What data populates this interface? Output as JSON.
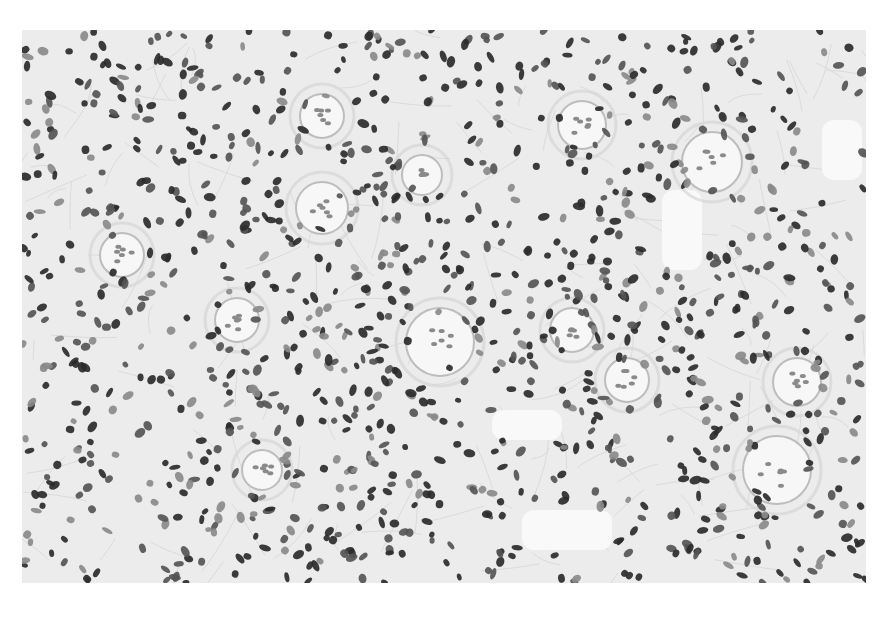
{
  "image": {
    "kind": "histology-micrograph",
    "stain": "grayscale",
    "panel": {
      "x": 22,
      "y": 30,
      "width": 844,
      "height": 553
    },
    "colors": {
      "page_background": "#ffffff",
      "stroma": "#ececec",
      "stroma_fiber": "#d6d6d6",
      "nucleus_dark": "#2b2b2b",
      "nucleus_mid": "#555555",
      "nucleus_light": "#8a8a8a",
      "whorl_fill": "#f7f7f7",
      "whorl_edge": "#bdbdbd",
      "clear_space": "#fbfbfb"
    },
    "whorls": [
      {
        "cx": 418,
        "cy": 312,
        "r": 34
      },
      {
        "cx": 300,
        "cy": 178,
        "r": 26
      },
      {
        "cx": 690,
        "cy": 132,
        "r": 30
      },
      {
        "cx": 300,
        "cy": 86,
        "r": 22
      },
      {
        "cx": 775,
        "cy": 352,
        "r": 24
      },
      {
        "cx": 755,
        "cy": 440,
        "r": 34
      },
      {
        "cx": 215,
        "cy": 290,
        "r": 22
      },
      {
        "cx": 560,
        "cy": 95,
        "r": 24
      },
      {
        "cx": 100,
        "cy": 225,
        "r": 22
      },
      {
        "cx": 605,
        "cy": 350,
        "r": 22
      },
      {
        "cx": 550,
        "cy": 300,
        "r": 22
      },
      {
        "cx": 240,
        "cy": 440,
        "r": 20
      },
      {
        "cx": 400,
        "cy": 145,
        "r": 20
      }
    ],
    "clear_regions": [
      {
        "x": 640,
        "y": 160,
        "w": 40,
        "h": 80
      },
      {
        "x": 800,
        "y": 90,
        "w": 40,
        "h": 60
      },
      {
        "x": 470,
        "y": 380,
        "w": 70,
        "h": 30
      },
      {
        "x": 500,
        "y": 480,
        "w": 90,
        "h": 40
      }
    ],
    "nuclei_seed": 7,
    "nuclei_count": 1150,
    "nuclei_density_bias": [
      {
        "cx": 340,
        "cy": 230,
        "r": 120,
        "weight": 1.4
      },
      {
        "cx": 600,
        "cy": 250,
        "r": 120,
        "weight": 1.5
      },
      {
        "cx": 160,
        "cy": 120,
        "r": 100,
        "weight": 1.3
      },
      {
        "cx": 700,
        "cy": 500,
        "r": 110,
        "weight": 1.2
      },
      {
        "cx": 300,
        "cy": 470,
        "r": 120,
        "weight": 1.3
      }
    ]
  }
}
